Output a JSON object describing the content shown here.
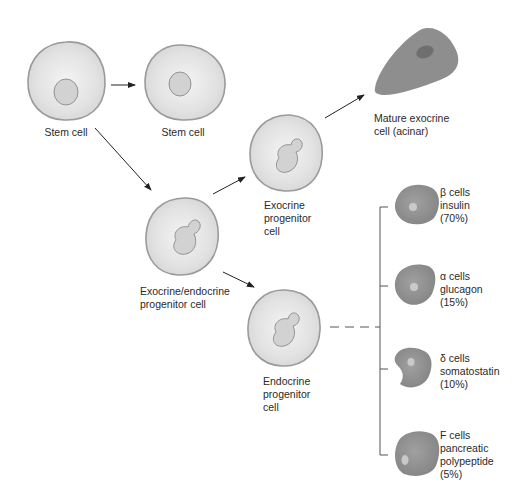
{
  "diagram": {
    "type": "cell differentiation flow",
    "colors": {
      "cell_fill_light": "#e6e6e6",
      "cell_outline": "#9a9a9a",
      "nucleus_fill": "#cfcfcf",
      "nucleus_outline": "#8a8a8a",
      "mature_cell_fill": "#8e8e8e",
      "mature_nucleus": "#6f6f6f",
      "arrow": "#222222",
      "bracket": "#555555"
    },
    "nodes": {
      "stem_cell_1": {
        "label": "Stem cell"
      },
      "stem_cell_2": {
        "label": "Stem cell"
      },
      "exo_endo_progenitor": {
        "label": "Exocrine/endocrine\nprogenitor cell"
      },
      "exocrine_progenitor": {
        "label": "Exocrine\nprogenitor\ncell"
      },
      "endocrine_progenitor": {
        "label": "Endocrine\nprogenitor\ncell"
      },
      "mature_exocrine": {
        "label": "Mature exocrine\ncell (acinar)"
      }
    },
    "endocrine_types": [
      {
        "name": "β cells",
        "hormone": "insulin",
        "percent": "(70%)",
        "label": "β cells\ninsulin\n(70%)"
      },
      {
        "name": "α cells",
        "hormone": "glucagon",
        "percent": "(15%)",
        "label": "α cells\nglucagon\n(15%)"
      },
      {
        "name": "δ cells",
        "hormone": "somatostatin",
        "percent": "(10%)",
        "label": "δ cells\nsomatostatin\n(10%)"
      },
      {
        "name": "F cells",
        "hormone": "pancreatic polypeptide",
        "percent": "(5%)",
        "label": "F cells\npancreatic\npolypeptide\n(5%)"
      }
    ]
  }
}
